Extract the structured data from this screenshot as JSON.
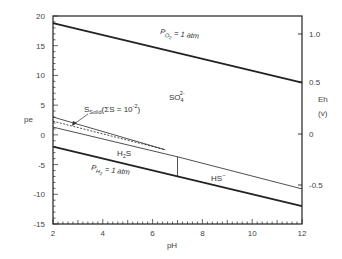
{
  "chart_data": {
    "type": "line",
    "title": "",
    "xlabel": "pH",
    "ylabel": "pe",
    "y2label": "Eh",
    "y2unit": "(v)",
    "xlim": [
      2,
      12
    ],
    "ylim": [
      -15,
      20
    ],
    "x_ticks": [
      "2",
      "4",
      "6",
      "8",
      "10",
      "12"
    ],
    "y_ticks": [
      "20",
      "15",
      "10",
      "5",
      "0",
      "-5",
      "-10",
      "-15"
    ],
    "y2_ticks": [
      "1.0",
      "0.5",
      "0",
      "-0.5"
    ],
    "grid": false,
    "legend": "none",
    "series": [
      {
        "name": "P_O2 = 1 atm",
        "style": "thick",
        "x": [
          2,
          12
        ],
        "y": [
          18.8,
          8.8
        ]
      },
      {
        "name": "P_H2 = 1 atm",
        "style": "thick",
        "x": [
          2,
          12
        ],
        "y": [
          -2.0,
          -12.0
        ]
      },
      {
        "name": "S_solid upper boundary",
        "style": "thin",
        "x": [
          2,
          6.5
        ],
        "y": [
          3.0,
          -2.5
        ]
      },
      {
        "name": "S_solid dashed boundary",
        "style": "dashed",
        "x": [
          2,
          6.5
        ],
        "y": [
          2.3,
          -2.5
        ]
      },
      {
        "name": "SO4/H2S boundary",
        "style": "thin",
        "x": [
          2,
          7
        ],
        "y": [
          1.3,
          -3.7
        ]
      },
      {
        "name": "SO4/HS- boundary",
        "style": "thin",
        "x": [
          7,
          12
        ],
        "y": [
          -3.7,
          -9.1
        ]
      },
      {
        "name": "H2S/HS- boundary",
        "style": "thin",
        "x": [
          7,
          7
        ],
        "y": [
          -3.7,
          -7.1
        ]
      }
    ],
    "annotations": {
      "po2": {
        "label_main": "P",
        "label_sub": "O",
        "label_sub2": "2",
        "label_rest": " = 1 atm"
      },
      "ph2": {
        "label_main": "P",
        "label_sub": "H",
        "label_sub2": "2",
        "label_rest": " = 1 atm"
      },
      "so4": {
        "main": "SO",
        "sub": "4",
        "sup": "2-"
      },
      "h2s": {
        "main1": "H",
        "sub": "2",
        "main2": "S"
      },
      "hs": {
        "main": "HS",
        "sup": "−"
      },
      "ssolid": {
        "main": "S",
        "sub": "Solid",
        "rest1": "(ΣS = 10",
        "sup": "-2",
        "rest2": ")"
      }
    }
  }
}
